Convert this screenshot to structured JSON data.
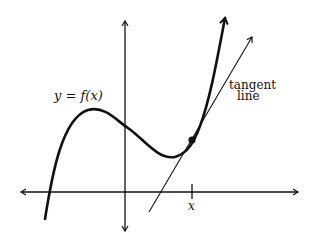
{
  "diagram": {
    "curve_label": "y = f(x)",
    "tangent_label_line1": "tangent",
    "tangent_label_line2": "line",
    "x_tick_label": "x",
    "colors": {
      "stroke": "#111111",
      "background": "#ffffff"
    }
  }
}
